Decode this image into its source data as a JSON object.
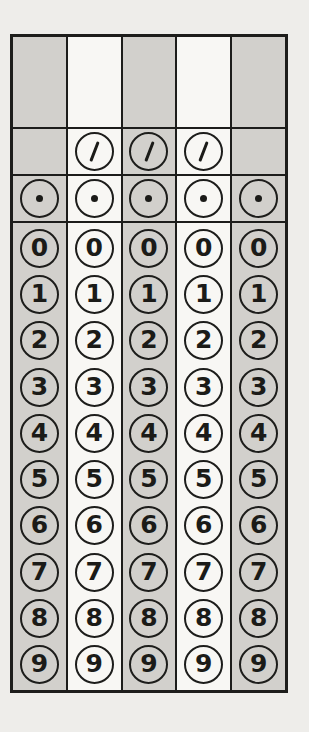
{
  "grid": {
    "type": "grid-in-response-block",
    "description": "Standardized test grid-in answer bubble grid",
    "slash_symbol": "/",
    "decimal_symbol": ".",
    "digits": [
      "0",
      "1",
      "2",
      "3",
      "4",
      "5",
      "6",
      "7",
      "8",
      "9"
    ],
    "columns": [
      {
        "index": 1,
        "shaded": true,
        "has_write_in_box": true,
        "has_slash": false,
        "has_decimal": true
      },
      {
        "index": 2,
        "shaded": false,
        "has_write_in_box": true,
        "has_slash": true,
        "has_decimal": true
      },
      {
        "index": 3,
        "shaded": true,
        "has_write_in_box": true,
        "has_slash": true,
        "has_decimal": true
      },
      {
        "index": 4,
        "shaded": false,
        "has_write_in_box": true,
        "has_slash": true,
        "has_decimal": true
      },
      {
        "index": 5,
        "shaded": true,
        "has_write_in_box": true,
        "has_slash": false,
        "has_decimal": true
      }
    ],
    "colors": {
      "page_background": "#eeedea",
      "shaded_column": "#d2d0cc",
      "unshaded_column": "#f8f7f4",
      "grid_line": "#1d1d1b",
      "ink": "#1b1b18"
    }
  }
}
